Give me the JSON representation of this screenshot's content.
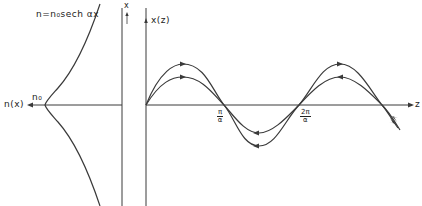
{
  "figure": {
    "left_panel": {
      "equation_label": "n = n₀sech αx",
      "equation_text": "n=n₀sech αx",
      "axis_label": "n(x)",
      "peak_label": "n₀",
      "vertical_axis_label": "x"
    },
    "right_panel": {
      "vertical_axis_label": "x(z)",
      "horizontal_axis_label": "z",
      "tick_labels": [
        {
          "num": "π",
          "den": "α"
        },
        {
          "num": "2π",
          "den": "α"
        }
      ],
      "rays": [
        {
          "name": "outer-ray",
          "amplitude_px": 41
        },
        {
          "name": "inner-ray",
          "amplitude_px": 28
        }
      ]
    },
    "stroke_color": "#3a3a3a"
  }
}
